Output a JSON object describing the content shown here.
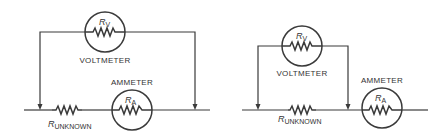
{
  "diagrams": [
    {
      "id": "left",
      "description": "Voltmeter across both unknown resistor and ammeter",
      "voltmeter": {
        "label": "VOLTMETER",
        "resistor_symbol": "R",
        "resistor_sub": "V"
      },
      "ammeter": {
        "label": "AMMETER",
        "resistor_symbol": "R",
        "resistor_sub": "A"
      },
      "unknown": {
        "resistor_symbol": "R",
        "resistor_sub": "UNKNOWN"
      }
    },
    {
      "id": "right",
      "description": "Voltmeter across unknown resistor only",
      "voltmeter": {
        "label": "VOLTMETER",
        "resistor_symbol": "R",
        "resistor_sub": "V"
      },
      "ammeter": {
        "label": "AMMETER",
        "resistor_symbol": "R",
        "resistor_sub": "A"
      },
      "unknown": {
        "resistor_symbol": "R",
        "resistor_sub": "UNKNOWN"
      }
    }
  ],
  "colors": {
    "line": "#3a3a3a",
    "text": "#333333",
    "background": "#ffffff"
  }
}
